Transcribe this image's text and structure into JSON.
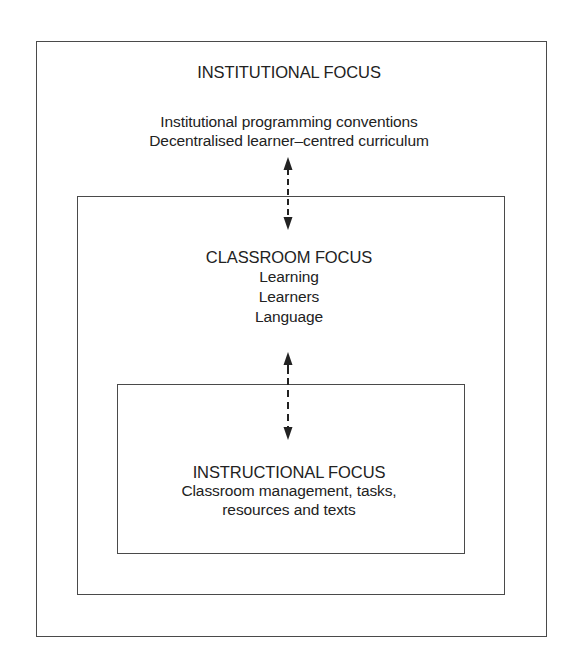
{
  "diagram": {
    "type": "nested-boxes",
    "colors": {
      "line": "#4a4a4a",
      "text": "#222222",
      "background": "#ffffff"
    },
    "outer": {
      "title": "INSTITUTIONAL FOCUS",
      "lines": [
        "Institutional programming conventions",
        "Decentralised learner–centred curriculum"
      ]
    },
    "middle": {
      "title": "CLASSROOM FOCUS",
      "lines": [
        "Learning",
        "Learners",
        "Language"
      ]
    },
    "inner": {
      "title": "INSTRUCTIONAL FOCUS",
      "lines": [
        "Classroom management, tasks,",
        "resources and texts"
      ]
    },
    "connectors": [
      {
        "from": "outer",
        "to": "middle",
        "style": "dashed",
        "heads": "double",
        "icon": "double-headed-dashed-arrow"
      },
      {
        "from": "middle",
        "to": "inner",
        "style": "dashed",
        "heads": "double",
        "icon": "double-headed-dashed-arrow"
      }
    ]
  }
}
